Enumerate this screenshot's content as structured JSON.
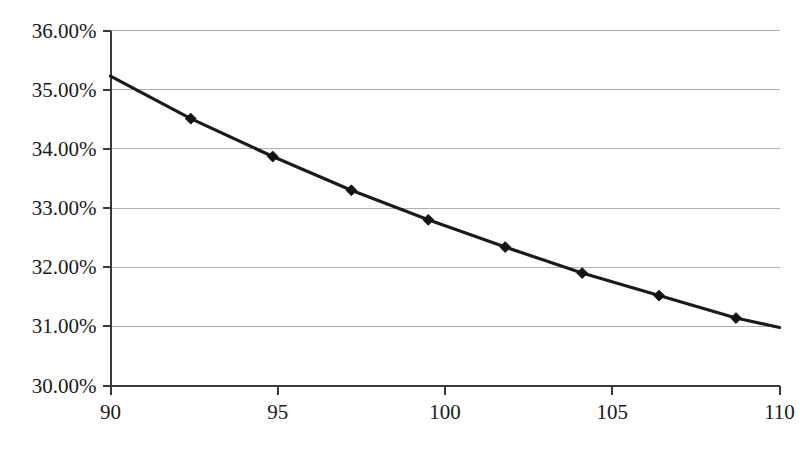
{
  "chart_data": {
    "type": "line",
    "title": "",
    "xlabel": "",
    "ylabel": "",
    "xlim": [
      90,
      110
    ],
    "ylim": [
      30,
      36
    ],
    "xticks": [
      90,
      95,
      100,
      105,
      110
    ],
    "xtick_labels": [
      "90",
      "95",
      "100",
      "105",
      "110"
    ],
    "yticks": [
      30,
      31,
      32,
      33,
      34,
      35,
      36
    ],
    "ytick_labels": [
      "30.00%",
      "31.00%",
      "32.00%",
      "33.00%",
      "34.00%",
      "35.00%",
      "36.00%"
    ],
    "grid": "horizontal",
    "legend": "none",
    "series": [
      {
        "name": "series-1",
        "marker": "diamond",
        "line_color": "#1b1b1b",
        "marker_color": "#141414",
        "points": [
          {
            "x": 90.0,
            "y": 35.23,
            "marker": false
          },
          {
            "x": 92.4,
            "y": 34.51,
            "marker": true
          },
          {
            "x": 94.85,
            "y": 33.87,
            "marker": true
          },
          {
            "x": 97.2,
            "y": 33.3,
            "marker": true
          },
          {
            "x": 99.5,
            "y": 32.8,
            "marker": true
          },
          {
            "x": 101.8,
            "y": 32.34,
            "marker": true
          },
          {
            "x": 104.1,
            "y": 31.9,
            "marker": true
          },
          {
            "x": 106.4,
            "y": 31.52,
            "marker": true
          },
          {
            "x": 108.7,
            "y": 31.14,
            "marker": true
          },
          {
            "x": 110.0,
            "y": 30.98,
            "marker": false
          }
        ]
      }
    ]
  },
  "axes": {
    "y_axis_name": "y-axis",
    "x_axis_name": "x-axis"
  }
}
